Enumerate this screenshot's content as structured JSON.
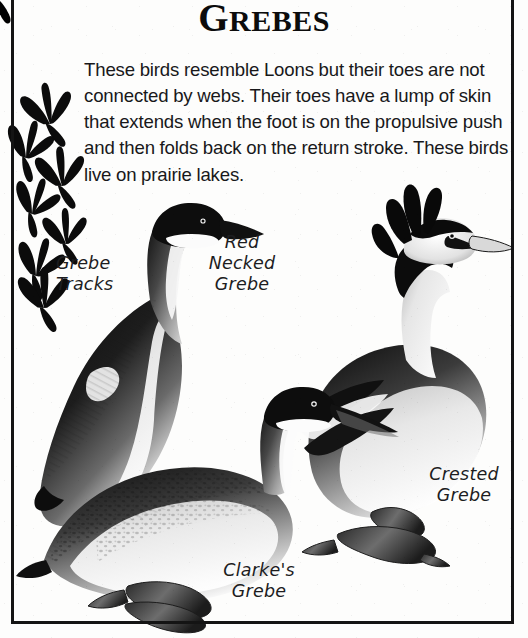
{
  "page": {
    "title": "GREBES",
    "title_first_letter": "G",
    "title_rest": "REBES",
    "background_color": "#fdfdfc",
    "border_color": "#141414",
    "ink_color": "#141414",
    "body_text": "These birds resemble Loons but their toes are not connected by webs. Their toes have a lump of skin that extends when the foot is on the propulsive push and then folds back on the return stroke. These birds live on prairie lakes."
  },
  "labels": {
    "tracks": "Grebe\nTracks",
    "red_necked": "Red\nNecked\nGrebe",
    "crested": "Crested\nGrebe",
    "clarkes": "Clarke's\nGrebe"
  },
  "illustrations": {
    "grebe_tracks": {
      "name": "grebe-tracks",
      "count": 7,
      "description": "trail of lobed three-toed grebe footprints"
    },
    "red_necked_grebe": {
      "name": "red-necked-grebe",
      "description": "grebe facing right with dark cap, white cheek, dark back and pale breast"
    },
    "clarkes_grebe": {
      "name": "clarkes-grebe",
      "description": "grebe with speckled back, long thin bill, lobed feet, swimming pose"
    },
    "crested_grebe": {
      "name": "crested-grebe",
      "description": "grebe with black head tufts and ruff, pale neck, lobed feet"
    }
  }
}
